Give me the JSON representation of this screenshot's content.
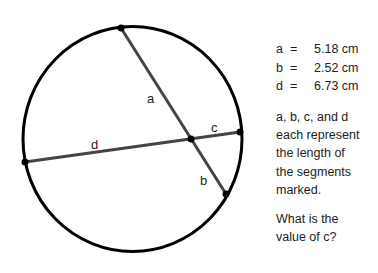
{
  "diagram": {
    "labels": {
      "a": "a",
      "b": "b",
      "c": "c",
      "d": "d"
    },
    "colors": {
      "circle": "#000000",
      "chords": "#444444",
      "points": "#000000"
    }
  },
  "measurements": [
    {
      "var": "a",
      "eq": "=",
      "value": "5.18 cm"
    },
    {
      "var": "b",
      "eq": "=",
      "value": "2.52 cm"
    },
    {
      "var": "d",
      "eq": "=",
      "value": "6.73 cm"
    }
  ],
  "description": [
    "a, b, c, and d",
    "each represent",
    "the length of",
    "the segments",
    "marked."
  ],
  "question": [
    "What is the",
    "value of c?"
  ]
}
